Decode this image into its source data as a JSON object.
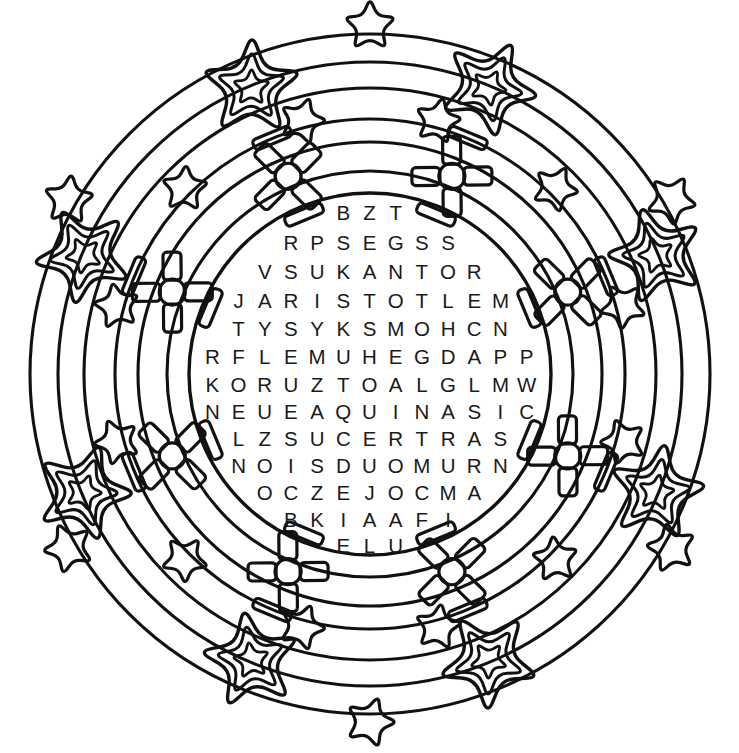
{
  "page": {
    "background_color": "#ffffff",
    "ink_color": "#111111",
    "width": 739,
    "height": 753
  },
  "puzzle": {
    "type": "circular-word-search",
    "center_x": 370,
    "center_y": 374,
    "inner_circle_radius": 181,
    "rows": 13,
    "grid": [
      "BZT",
      "RPSEGSS",
      "VSUKANTOR",
      "JARISTOTLEM",
      "TYSYKSMOHCN",
      "RFLEMUHEGDAPP",
      "KORUZTOALGLMW",
      "NEUEAQUINASIC",
      "LZSUCERTRAS",
      "NOISDUOMURN",
      "OCZEJOCMA",
      "BKIAAFI",
      "ELU"
    ],
    "row_offsets_y": [
      213,
      243,
      272,
      301,
      329,
      357,
      385,
      412,
      439,
      466,
      493,
      520,
      546
    ],
    "row_letter_counts": [
      3,
      7,
      9,
      11,
      11,
      13,
      13,
      13,
      11,
      11,
      9,
      7,
      3
    ]
  },
  "decoration": {
    "description": "Three concentric decorative bands of stars and pinwheels surrounding the central letter circle",
    "bands": [
      {
        "name": "inner-band",
        "radius": 214,
        "motif": "pinwheel",
        "count": 8,
        "label": "Inner pinwheel ring"
      },
      {
        "name": "middle-band",
        "radius": 262,
        "motif": "star-small",
        "count": 12,
        "label": "Middle small-star ring"
      },
      {
        "name": "outer-band",
        "radius": 310,
        "motif": "star-layered",
        "count": 8,
        "label": "Outer layered-star ring"
      },
      {
        "name": "rim-band",
        "radius": 348,
        "motif": "star-small",
        "count": 12,
        "label": "Outer rim small-star ring"
      }
    ],
    "arc_rings": [
      181,
      203,
      232,
      255,
      286,
      312,
      340
    ],
    "star_points": 5,
    "pinwheel_blades": 4
  }
}
